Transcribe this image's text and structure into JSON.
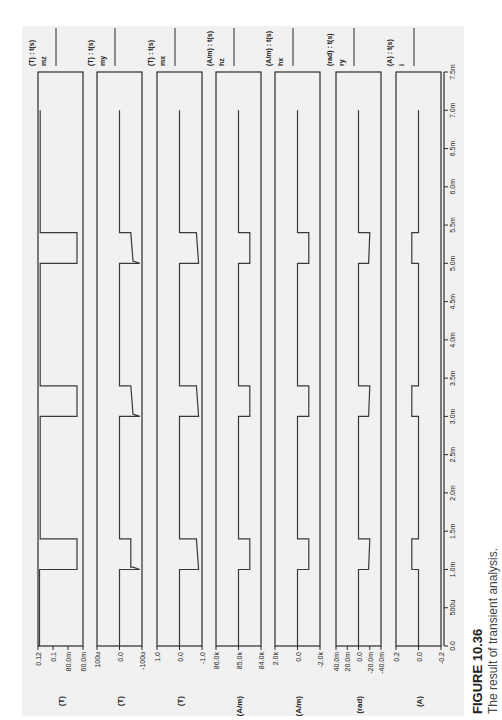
{
  "figure": {
    "label": "FIGURE 10.36",
    "caption": "The result of transient analysis.",
    "orientation": "rotated 90° counter-clockwise (time axis runs bottom to top)"
  },
  "chart_data": {
    "type": "line",
    "title": "The result of transient analysis.",
    "xlabel": "t (s)",
    "x_ticks": [
      "0.0",
      "500u",
      "1.0m",
      "1.5m",
      "2.0m",
      "2.5m",
      "3.0m",
      "3.5m",
      "4.0m",
      "4.5m",
      "5.0m",
      "5.5m",
      "6.0m",
      "6.5m",
      "7.0m",
      "7.5m"
    ],
    "xlim": [
      0,
      0.0075
    ],
    "grid": false,
    "series": [
      {
        "name": "mz",
        "header": "(T) : t(s)",
        "unit": "(T)",
        "y_ticks": [
          "0.12",
          "0.1",
          "80.0m",
          "60.0m"
        ],
        "ylim": [
          0.06,
          0.12
        ],
        "points": [
          [
            0,
            0.118
          ],
          [
            0.001,
            0.118
          ],
          [
            0.001,
            0.068
          ],
          [
            0.0014,
            0.068
          ],
          [
            0.0014,
            0.117
          ],
          [
            0.003,
            0.117
          ],
          [
            0.003,
            0.068
          ],
          [
            0.0034,
            0.068
          ],
          [
            0.0034,
            0.117
          ],
          [
            0.005,
            0.117
          ],
          [
            0.005,
            0.068
          ],
          [
            0.0054,
            0.068
          ],
          [
            0.0054,
            0.117
          ],
          [
            0.007,
            0.117
          ]
        ]
      },
      {
        "name": "my",
        "header": "(T) : t(s)",
        "unit": "(T)",
        "y_ticks": [
          "100u",
          "0.0",
          "-100u"
        ],
        "ylim": [
          -0.0001,
          0.0001
        ],
        "points": [
          [
            0,
            0
          ],
          [
            0.001,
            0
          ],
          [
            0.001,
            -9e-05
          ],
          [
            0.00103,
            -6e-05
          ],
          [
            0.00103,
            -5e-05
          ],
          [
            0.0014,
            -5e-05
          ],
          [
            0.0014,
            0
          ],
          [
            0.003,
            0
          ],
          [
            0.003,
            -9e-05
          ],
          [
            0.00303,
            -6e-05
          ],
          [
            0.0034,
            -5e-05
          ],
          [
            0.0034,
            0
          ],
          [
            0.005,
            0
          ],
          [
            0.005,
            -9e-05
          ],
          [
            0.00503,
            -6e-05
          ],
          [
            0.0054,
            -5e-05
          ],
          [
            0.0054,
            0
          ],
          [
            0.007,
            0
          ]
        ]
      },
      {
        "name": "mx",
        "header": "(T) : t(s)",
        "unit": "(T)",
        "y_ticks": [
          "1.0",
          "0.0",
          "-1.0"
        ],
        "ylim": [
          -1.0,
          1.0
        ],
        "points": [
          [
            0,
            0
          ],
          [
            0.001,
            0
          ],
          [
            0.001,
            -0.85
          ],
          [
            0.0014,
            -0.75
          ],
          [
            0.0014,
            0
          ],
          [
            0.003,
            0
          ],
          [
            0.003,
            -0.85
          ],
          [
            0.0034,
            -0.75
          ],
          [
            0.0034,
            0
          ],
          [
            0.005,
            0
          ],
          [
            0.005,
            -0.85
          ],
          [
            0.0054,
            -0.75
          ],
          [
            0.0054,
            0
          ],
          [
            0.007,
            0
          ]
        ]
      },
      {
        "name": "hz",
        "header": "(A/m) : t(s)",
        "unit": "(A/m)",
        "y_ticks": [
          "86.0k",
          "85.0k",
          "84.0k"
        ],
        "ylim": [
          84000,
          86000
        ],
        "points": [
          [
            0,
            85000
          ],
          [
            0.001,
            85000
          ],
          [
            0.001,
            84500
          ],
          [
            0.0014,
            84500
          ],
          [
            0.0014,
            85000
          ],
          [
            0.003,
            85000
          ],
          [
            0.003,
            84500
          ],
          [
            0.0034,
            84500
          ],
          [
            0.0034,
            85000
          ],
          [
            0.005,
            85000
          ],
          [
            0.005,
            84500
          ],
          [
            0.0054,
            84500
          ],
          [
            0.0054,
            85000
          ],
          [
            0.007,
            85000
          ]
        ]
      },
      {
        "name": "hx",
        "header": "(A/m) : t(s)",
        "unit": "(A/m)",
        "y_ticks": [
          "2.0k",
          "0.0",
          "-2.0k"
        ],
        "ylim": [
          -2000,
          2000
        ],
        "points": [
          [
            0,
            0
          ],
          [
            0.001,
            0
          ],
          [
            0.001,
            -1000
          ],
          [
            0.0014,
            -1000
          ],
          [
            0.0014,
            0
          ],
          [
            0.003,
            0
          ],
          [
            0.003,
            -1000
          ],
          [
            0.0034,
            -1000
          ],
          [
            0.0034,
            0
          ],
          [
            0.005,
            0
          ],
          [
            0.005,
            -1000
          ],
          [
            0.0054,
            -1000
          ],
          [
            0.0054,
            0
          ],
          [
            0.007,
            0
          ]
        ]
      },
      {
        "name": "ry",
        "header": "(rad) : t(s)",
        "unit": "(rad)",
        "y_ticks": [
          "40.0m",
          "20.0m",
          "0.0",
          "-20.0m",
          "-40.0m"
        ],
        "ylim": [
          -0.04,
          0.04
        ],
        "points": [
          [
            0,
            0
          ],
          [
            0.001,
            0
          ],
          [
            0.001,
            -0.018
          ],
          [
            0.0014,
            -0.02
          ],
          [
            0.0014,
            0
          ],
          [
            0.003,
            0
          ],
          [
            0.003,
            -0.018
          ],
          [
            0.0034,
            -0.02
          ],
          [
            0.0034,
            0
          ],
          [
            0.005,
            0
          ],
          [
            0.005,
            -0.018
          ],
          [
            0.0054,
            -0.02
          ],
          [
            0.0054,
            0
          ],
          [
            0.007,
            0
          ]
        ]
      },
      {
        "name": "i",
        "header": "(A) : t(s)",
        "unit": "(A)",
        "y_ticks": [
          "0.2",
          "0.0",
          "-0.2"
        ],
        "ylim": [
          -0.2,
          0.2
        ],
        "points": [
          [
            0,
            0
          ],
          [
            0.001,
            0
          ],
          [
            0.001,
            0.06
          ],
          [
            0.0014,
            0.06
          ],
          [
            0.0014,
            0
          ],
          [
            0.003,
            0
          ],
          [
            0.003,
            0.06
          ],
          [
            0.0034,
            0.06
          ],
          [
            0.0034,
            0
          ],
          [
            0.005,
            0
          ],
          [
            0.005,
            0.06
          ],
          [
            0.0054,
            0.06
          ],
          [
            0.0054,
            0
          ],
          [
            0.007,
            0
          ]
        ]
      }
    ]
  },
  "style": {
    "panel_bg": "#f1f1f1",
    "frame_color": "#2b2b2b",
    "trace_color": "#3a3a3a",
    "text_color": "#222222"
  }
}
